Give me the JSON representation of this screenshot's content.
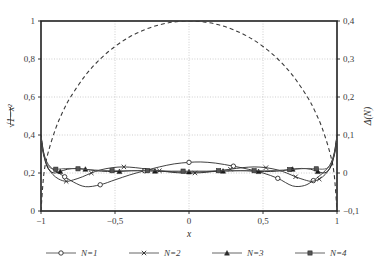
{
  "chart_data": {
    "type": "line",
    "title": "",
    "xlabel": "x",
    "ylabel_left": "√1−x²",
    "ylabel_right": "Δ(N)",
    "xlim": [
      -1,
      1
    ],
    "ylim_left": [
      0,
      1
    ],
    "ylim_right": [
      -0.1,
      0.4
    ],
    "xticks": [
      "−1",
      "−0,5",
      "0",
      "0,5",
      "1"
    ],
    "xtick_values": [
      -1,
      -0.5,
      0,
      0.5,
      1
    ],
    "yticks_left": [
      "0",
      "0,2",
      "0,4",
      "0,6",
      "0,8",
      "1"
    ],
    "ytick_values_left": [
      0,
      0.2,
      0.4,
      0.6,
      0.8,
      1
    ],
    "yticks_right": [
      "−0,1",
      "0",
      "0,1",
      "0,2",
      "0,3",
      "0,4"
    ],
    "ytick_values_right": [
      -0.1,
      0,
      0.1,
      0.2,
      0.3,
      0.4
    ],
    "grid": true,
    "legend_position": "bottom",
    "series": [
      {
        "name": "reference",
        "label": "√1−x²",
        "axis": "left",
        "style": "dashed",
        "marker": "none",
        "color": "#3a3a3a",
        "x": [
          -1.0,
          -0.98,
          -0.95,
          -0.9,
          -0.85,
          -0.8,
          -0.7,
          -0.6,
          -0.5,
          -0.4,
          -0.3,
          -0.2,
          -0.1,
          0.0,
          0.1,
          0.2,
          0.3,
          0.4,
          0.5,
          0.6,
          0.7,
          0.8,
          0.85,
          0.9,
          0.95,
          0.98,
          1.0
        ],
        "y": [
          0.0,
          0.199,
          0.312,
          0.436,
          0.527,
          0.6,
          0.714,
          0.8,
          0.866,
          0.917,
          0.954,
          0.98,
          0.995,
          1.0,
          0.995,
          0.98,
          0.954,
          0.917,
          0.866,
          0.8,
          0.714,
          0.6,
          0.527,
          0.436,
          0.312,
          0.199,
          0.0
        ]
      },
      {
        "name": "N1",
        "label": "N=1",
        "axis": "right",
        "style": "solid",
        "marker": "circle-open",
        "color": "#2b2b2b",
        "x": [
          -1.0,
          -0.985,
          -0.97,
          -0.95,
          -0.92,
          -0.88,
          -0.84,
          -0.78,
          -0.7,
          -0.6,
          -0.5,
          -0.4,
          -0.3,
          -0.2,
          -0.1,
          0.0,
          0.08,
          0.18,
          0.3,
          0.4,
          0.5,
          0.6,
          0.7,
          0.78,
          0.84,
          0.88,
          0.92,
          0.95,
          0.97,
          0.985,
          1.0
        ],
        "y": [
          0.098,
          0.06,
          0.038,
          0.022,
          0.01,
          0.0,
          -0.01,
          -0.024,
          -0.036,
          -0.031,
          -0.018,
          -0.005,
          0.006,
          0.016,
          0.024,
          0.028,
          0.029,
          0.026,
          0.018,
          0.01,
          0.0,
          -0.014,
          -0.034,
          -0.033,
          -0.02,
          -0.008,
          0.006,
          0.02,
          0.037,
          0.06,
          0.098
        ]
      },
      {
        "name": "N2",
        "label": "N=2",
        "axis": "right",
        "style": "solid",
        "marker": "x",
        "color": "#2b2b2b",
        "x": [
          -1.0,
          -0.985,
          -0.97,
          -0.95,
          -0.92,
          -0.88,
          -0.83,
          -0.78,
          -0.72,
          -0.66,
          -0.6,
          -0.52,
          -0.44,
          -0.36,
          -0.28,
          -0.2,
          -0.12,
          -0.04,
          0.04,
          0.12,
          0.2,
          0.28,
          0.36,
          0.44,
          0.52,
          0.6,
          0.66,
          0.72,
          0.78,
          0.83,
          0.88,
          0.92,
          0.95,
          0.97,
          0.985,
          1.0
        ],
        "y": [
          0.098,
          0.058,
          0.032,
          0.012,
          -0.004,
          -0.016,
          -0.022,
          -0.018,
          -0.01,
          0.0,
          0.008,
          0.014,
          0.016,
          0.014,
          0.01,
          0.006,
          0.002,
          0.0,
          0.0,
          0.002,
          0.006,
          0.01,
          0.014,
          0.016,
          0.014,
          0.008,
          0.0,
          -0.01,
          -0.018,
          -0.022,
          -0.016,
          -0.004,
          0.012,
          0.032,
          0.058,
          0.098
        ]
      },
      {
        "name": "N3",
        "label": "N=3",
        "axis": "right",
        "style": "solid",
        "marker": "triangle-filled",
        "color": "#1a1a1a",
        "x": [
          -1.0,
          -0.99,
          -0.975,
          -0.96,
          -0.94,
          -0.91,
          -0.87,
          -0.82,
          -0.76,
          -0.7,
          -0.63,
          -0.55,
          -0.47,
          -0.39,
          -0.31,
          -0.23,
          -0.15,
          -0.07,
          0.0,
          0.07,
          0.15,
          0.23,
          0.31,
          0.39,
          0.47,
          0.55,
          0.63,
          0.7,
          0.76,
          0.82,
          0.87,
          0.91,
          0.94,
          0.96,
          0.975,
          0.99,
          1.0
        ],
        "y": [
          0.098,
          0.062,
          0.036,
          0.018,
          0.006,
          0.0,
          0.004,
          0.01,
          0.012,
          0.01,
          0.006,
          0.004,
          0.004,
          0.006,
          0.006,
          0.005,
          0.004,
          0.003,
          0.003,
          0.003,
          0.004,
          0.005,
          0.006,
          0.006,
          0.004,
          0.004,
          0.006,
          0.01,
          0.012,
          0.01,
          0.004,
          0.0,
          0.006,
          0.018,
          0.036,
          0.062,
          0.098
        ]
      },
      {
        "name": "N4",
        "label": "N=4",
        "axis": "right",
        "style": "solid",
        "marker": "square-filled",
        "color": "#555555",
        "x": [
          -1.0,
          -0.99,
          -0.978,
          -0.965,
          -0.95,
          -0.93,
          -0.9,
          -0.86,
          -0.81,
          -0.75,
          -0.68,
          -0.6,
          -0.52,
          -0.44,
          -0.36,
          -0.28,
          -0.2,
          -0.12,
          -0.04,
          0.04,
          0.12,
          0.2,
          0.28,
          0.36,
          0.44,
          0.52,
          0.6,
          0.68,
          0.75,
          0.81,
          0.86,
          0.9,
          0.93,
          0.95,
          0.965,
          0.978,
          0.99,
          1.0
        ],
        "y": [
          0.098,
          0.066,
          0.044,
          0.028,
          0.018,
          0.012,
          0.01,
          0.011,
          0.012,
          0.011,
          0.009,
          0.007,
          0.006,
          0.006,
          0.006,
          0.006,
          0.006,
          0.005,
          0.005,
          0.005,
          0.005,
          0.006,
          0.006,
          0.006,
          0.006,
          0.006,
          0.007,
          0.009,
          0.011,
          0.012,
          0.011,
          0.01,
          0.012,
          0.018,
          0.028,
          0.044,
          0.066,
          0.098
        ]
      }
    ],
    "legend": [
      {
        "label": "N=1",
        "marker": "circle-open"
      },
      {
        "label": "N=2",
        "marker": "x"
      },
      {
        "label": "N=3",
        "marker": "triangle-filled"
      },
      {
        "label": "N=4",
        "marker": "square-filled"
      }
    ]
  }
}
